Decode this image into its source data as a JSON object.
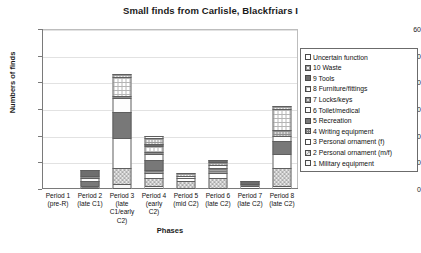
{
  "chart_data": {
    "type": "bar",
    "subtype": "stacked-bar",
    "title": "Small finds from Carlisle, Blackfriars I",
    "xlabel": "Phases",
    "ylabel": "Numbers of finds",
    "ylim": [
      0,
      60
    ],
    "yticks": [
      0,
      10,
      20,
      30,
      40,
      50,
      60
    ],
    "grid": true,
    "legend_position": "right",
    "categories": [
      "Period 1 (pre-R)",
      "Period 2 (late C1)",
      "Period 3 (late C1/early C2)",
      "Period 4 (early C2)",
      "Period 5 (mid C2)",
      "Period 6 (late C2)",
      "Period 7 (late C2)",
      "Period 8 (late C2)"
    ],
    "category_lines": [
      [
        "Period 1",
        "(pre-R)"
      ],
      [
        "Period 2",
        "(late C1)"
      ],
      [
        "Period 3",
        "(late",
        "C1/early",
        "C2)"
      ],
      [
        "Period 4",
        "(early",
        "C2)"
      ],
      [
        "Period 5",
        "(mid C2)"
      ],
      [
        "Period 6",
        "(late C2)"
      ],
      [
        "Period 7",
        "(late C2)"
      ],
      [
        "Period 8",
        "(late C2)"
      ]
    ],
    "series": [
      {
        "name": "1 Military equipment",
        "pattern": "p-pale",
        "values": [
          0,
          0,
          2,
          1,
          0,
          0,
          0,
          1
        ]
      },
      {
        "name": "2 Personal ornament (m/f)",
        "pattern": "p-check",
        "values": [
          0,
          0,
          6,
          3,
          3,
          4,
          0,
          7
        ]
      },
      {
        "name": "3 Personal ornament (f)",
        "pattern": "p-plain",
        "values": [
          0,
          0,
          11,
          2,
          1,
          2,
          1,
          5
        ]
      },
      {
        "name": "4 Writing equipment",
        "pattern": "p-dense",
        "values": [
          0,
          1,
          0,
          1,
          0,
          2,
          1,
          0
        ]
      },
      {
        "name": "5 Recreation",
        "pattern": "p-darkgrey",
        "values": [
          0,
          2,
          10,
          4,
          0,
          0,
          0,
          5
        ]
      },
      {
        "name": "6 Toilet/medical",
        "pattern": "p-verylight",
        "values": [
          0,
          1,
          5,
          2,
          1,
          1,
          0,
          2
        ]
      },
      {
        "name": "7 Locks/keys",
        "pattern": "p-midgrid",
        "values": [
          0,
          1,
          1,
          1,
          0,
          1,
          0,
          2
        ]
      },
      {
        "name": "8 Furniture/fittings",
        "pattern": "p-lightgrid",
        "values": [
          0,
          0,
          7,
          2,
          0,
          0,
          0,
          8
        ]
      },
      {
        "name": "9 Tools",
        "pattern": "p-dark",
        "values": [
          0,
          2,
          0,
          1,
          0,
          1,
          1,
          0
        ]
      },
      {
        "name": "10 Waste",
        "pattern": "p-grid",
        "values": [
          0,
          0,
          1,
          2,
          1,
          0,
          0,
          1
        ]
      },
      {
        "name": "Uncertain function",
        "pattern": "p-white",
        "values": [
          0,
          0,
          0,
          1,
          0,
          0,
          0,
          0
        ]
      }
    ],
    "totals": [
      0,
      7,
      43,
      19,
      6,
      11,
      3,
      31
    ]
  },
  "legend": {
    "items": [
      {
        "label": "Uncertain function",
        "pattern": "p-white"
      },
      {
        "label": "10 Waste",
        "pattern": "p-grid"
      },
      {
        "label": "9 Tools",
        "pattern": "p-dark"
      },
      {
        "label": "8 Furniture/fittings",
        "pattern": "p-lightgrid"
      },
      {
        "label": "7 Locks/keys",
        "pattern": "p-midgrid"
      },
      {
        "label": "6 Toilet/medical",
        "pattern": "p-verylight"
      },
      {
        "label": "5 Recreation",
        "pattern": "p-darkgrey"
      },
      {
        "label": "4 Writing equipment",
        "pattern": "p-dense"
      },
      {
        "label": "3 Personal ornament (f)",
        "pattern": "p-plain"
      },
      {
        "label": "2 Personal ornament (m/f)",
        "pattern": "p-check"
      },
      {
        "label": "1 Military equipment",
        "pattern": "p-pale"
      }
    ]
  },
  "colors": {
    "axis": "#7a7a7a",
    "grid": "#e2e2e2",
    "border": "#6b6b6b",
    "text": "#111111"
  }
}
